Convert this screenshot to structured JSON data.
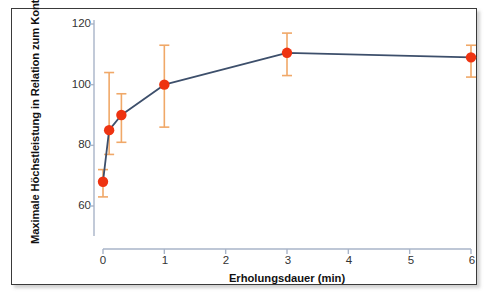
{
  "figure": {
    "background_color": "#ffffff",
    "frame_color": "#3a3a3a"
  },
  "chart_data": {
    "type": "line",
    "title": "",
    "subtitle": "",
    "xlabel": "Erholungsdauer (min)",
    "ylabel": "Maximale Höchstleistung in Relation zum Kontrolltest",
    "xlim": [
      0,
      6
    ],
    "ylim": [
      50,
      122
    ],
    "xticks": [
      0,
      1,
      2,
      3,
      4,
      5,
      6
    ],
    "xticklabels": [
      "0",
      "1",
      "2",
      "3",
      "4",
      "5",
      "6"
    ],
    "yticks": [
      60,
      80,
      100,
      120
    ],
    "yticklabels": [
      "60",
      "80",
      "100",
      "120"
    ],
    "grid": false,
    "legend": null,
    "legend_position": "none",
    "marker_color": "#ee3311",
    "line_color": "#3d4f6b",
    "errorbar_color": "#f0a868",
    "x": [
      0.0,
      0.1,
      0.3,
      1.0,
      3.0,
      6.0
    ],
    "y": [
      68,
      85,
      90,
      100,
      110.5,
      109
    ],
    "yerr_lower": [
      63,
      77,
      81,
      86,
      103,
      102.5
    ],
    "yerr_upper": [
      72,
      104,
      97,
      113,
      117,
      113
    ],
    "series": [
      {
        "name": "Maximale Höchstleistung",
        "x": [
          0.0,
          0.1,
          0.3,
          1.0,
          3.0,
          6.0
        ],
        "values": [
          68,
          85,
          90,
          100,
          110.5,
          109
        ]
      }
    ],
    "points": [
      {
        "x": 0.0,
        "y": 68,
        "err_low": 63,
        "err_high": 72
      },
      {
        "x": 0.1,
        "y": 85,
        "err_low": 77,
        "err_high": 104
      },
      {
        "x": 0.3,
        "y": 90,
        "err_low": 81,
        "err_high": 97
      },
      {
        "x": 1.0,
        "y": 100,
        "err_low": 86,
        "err_high": 113
      },
      {
        "x": 3.0,
        "y": 110.5,
        "err_low": 103,
        "err_high": 117
      },
      {
        "x": 6.0,
        "y": 109,
        "err_low": 102.5,
        "err_high": 113
      }
    ]
  }
}
